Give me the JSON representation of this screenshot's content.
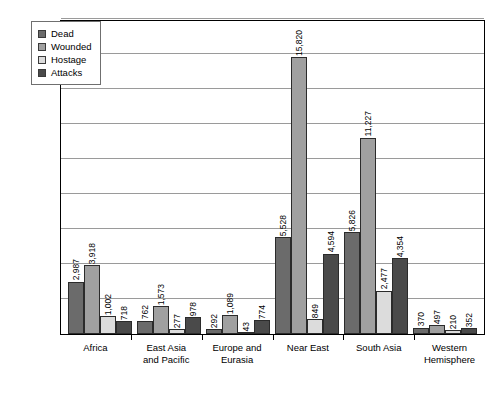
{
  "chart_data": {
    "type": "bar",
    "title": "",
    "subtitle": "",
    "xlabel": "",
    "ylabel": "",
    "ylim": [
      0,
      18000
    ],
    "y_tick_interval": 2000,
    "y_tick_labels_visible": false,
    "grid": true,
    "gridline_count": 9,
    "legend_position": "top-left",
    "value_labels": true,
    "value_label_orientation": "vertical",
    "categories": [
      "Africa",
      "East Asia and Pacific",
      "Europe and Eurasia",
      "Near East",
      "South Asia",
      "Western Hemisphere"
    ],
    "category_lines": [
      [
        "Africa",
        ""
      ],
      [
        "East Asia",
        "and Pacific"
      ],
      [
        "Europe and",
        "Eurasia"
      ],
      [
        "Near East",
        ""
      ],
      [
        "South Asia",
        ""
      ],
      [
        "Western",
        "Hemisphere"
      ]
    ],
    "series": [
      {
        "name": "Dead",
        "color": "#6b6b6b",
        "values": [
          2987,
          762,
          292,
          5528,
          5826,
          370
        ],
        "labels": [
          "2,987",
          "762",
          "292",
          "5,528",
          "5,826",
          "370"
        ]
      },
      {
        "name": "Wounded",
        "color": "#a0a0a0",
        "values": [
          3918,
          1573,
          1089,
          15820,
          11227,
          497
        ],
        "labels": [
          "3,918",
          "1,573",
          "1,089",
          "15,820",
          "11,227",
          "497"
        ]
      },
      {
        "name": "Hostage",
        "color": "#dcdcdc",
        "values": [
          1002,
          277,
          43,
          849,
          2477,
          210
        ],
        "labels": [
          "1,002",
          "277",
          "43",
          "849",
          "2,477",
          "210"
        ]
      },
      {
        "name": "Attacks",
        "color": "#4a4a4a",
        "values": [
          718,
          978,
          774,
          4594,
          4354,
          352
        ],
        "labels": [
          "718",
          "978",
          "774",
          "4,594",
          "4,354",
          "352"
        ]
      }
    ]
  },
  "legend": {
    "items": [
      {
        "label": "Dead",
        "color": "#6b6b6b",
        "icon": "square-swatch-icon"
      },
      {
        "label": "Wounded",
        "color": "#a0a0a0",
        "icon": "square-swatch-icon"
      },
      {
        "label": "Hostage",
        "color": "#dcdcdc",
        "icon": "square-swatch-icon"
      },
      {
        "label": "Attacks",
        "color": "#4a4a4a",
        "icon": "square-swatch-icon"
      }
    ]
  }
}
